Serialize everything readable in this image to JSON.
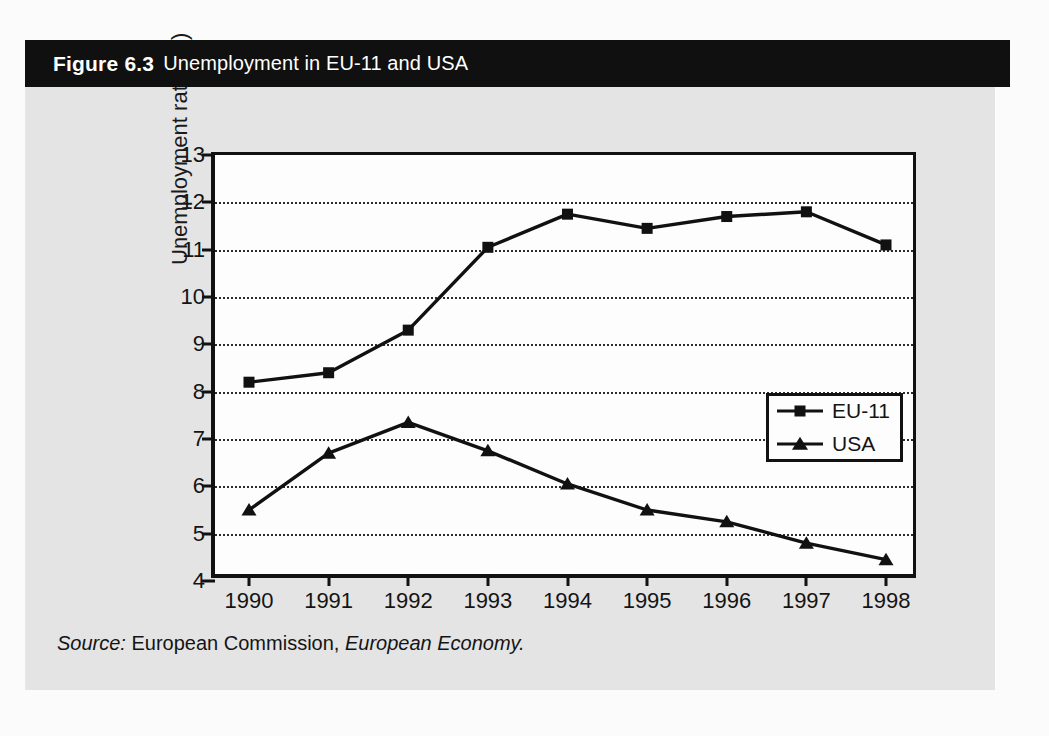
{
  "figure": {
    "number_label": "Figure 6.3",
    "title": "Unemployment in EU-11 and USA",
    "source_prefix": "Source:",
    "source_publisher": "European Commission,",
    "source_publication": "European Economy."
  },
  "colors": {
    "title_bar_bg": "#101010",
    "title_text": "#ffffff",
    "panel_bg": "#e4e4e4",
    "plot_bg": "#fdfdfd",
    "axis": "#111111",
    "series": "#111111",
    "gridline": "#2b2b2b"
  },
  "legend": {
    "position": "inside-right",
    "entries": [
      {
        "label": "EU-11",
        "marker": "square"
      },
      {
        "label": "USA",
        "marker": "triangle"
      }
    ]
  },
  "chart_data": {
    "type": "line",
    "title": "Unemployment in EU-11 and USA",
    "xlabel": "",
    "ylabel": "Unemployment rate (%)",
    "categories": [
      "1990",
      "1991",
      "1992",
      "1993",
      "1994",
      "1995",
      "1996",
      "1997",
      "1998"
    ],
    "x": [
      1990,
      1991,
      1992,
      1993,
      1994,
      1995,
      1996,
      1997,
      1998
    ],
    "ylim": [
      4,
      13
    ],
    "yticks": [
      4,
      5,
      6,
      7,
      8,
      9,
      10,
      11,
      12,
      13
    ],
    "ytick_labels": [
      "4",
      "5",
      "6",
      "7",
      "8",
      "9",
      "10",
      "11",
      "12",
      "13"
    ],
    "grid": "horizontal-dotted",
    "series": [
      {
        "name": "EU-11",
        "marker": "square",
        "values": [
          8.2,
          8.4,
          9.3,
          11.05,
          11.75,
          11.45,
          11.7,
          11.8,
          11.1
        ]
      },
      {
        "name": "USA",
        "marker": "triangle",
        "values": [
          5.5,
          6.7,
          7.35,
          6.75,
          6.05,
          5.5,
          5.25,
          4.8,
          4.45
        ]
      }
    ]
  }
}
